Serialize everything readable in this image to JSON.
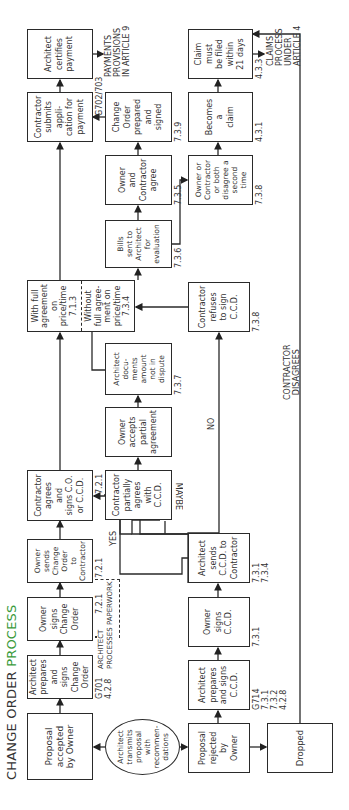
{
  "title": {
    "main": "CHANGE ORDER ",
    "accent": "PROCESS",
    "accent_color": "#3a9a3a"
  },
  "boxes": {
    "proposal_accepted": "Proposal\naccepted\nby Owner",
    "architect_prepares_co": "Architect\nprepares\nand signs\nChange\nOrder",
    "owner_signs_co": "Owner\nsigns\nChange\nOrder",
    "owner_sends_co": "Owner\nsends\nChange\nOrder\nto\nContractor",
    "contractor_agrees": "Contractor\nagrees\nand\nsigns C.O.\nor C.C.D.",
    "with_full_agreement": "With full\nagreement\non\nprice/time\n7.1.3",
    "without_full_agreement": "Without\nfull agree-\nment on\nprice/time\n7.3.4",
    "contractor_submits": "Contractor\nsubmits\nappli-\ncation for\npayment",
    "architect_certifies": "Architect\ncertifies\npayment",
    "architect_transmits": "Architect\ntransmits\nproposal\nwith\nrecommen-\ndations",
    "contractor_partially_agrees": "Contractor\npartially\nagrees\nwith\nC.C.D.",
    "owner_accepts_partial": "Owner\naccepts\npartial\nagreement",
    "architect_documents": "Architect\ndocu-\nments\namount\nnot in\ndispute",
    "bills_sent": "Bills\nsent to\nArchitect\nfor\nevaluation",
    "owner_contractor_agree": "Owner\nand\nContractor\nagree",
    "change_order_prepared": "Change\nOrder\nprepared\nand\nsigned",
    "proposal_rejected": "Proposal\nrejected\nby\nOwner",
    "architect_prepares_ccd": "Architect\nprepares\nand signs\nC.C.D.",
    "owner_signs_ccd": "Owner\nsigns\nC.C.D.",
    "architect_sends_ccd": "Architect\nsends\nC.C.D. to\nContractor",
    "contractor_refuses": "Contractor\nrefuses\nto sign\nC.C.D.",
    "disagree_second_time": "Owner or\nContractor\nor both\ndisagree a\nsecond\ntime",
    "becomes_claim": "Becomes\na\nclaim",
    "claim_filed": "Claim\nmust\nbe filed\nwithin\n21 days",
    "dropped": "Dropped"
  },
  "refs": {
    "g701": "G701\n4.2.8",
    "r721a": "7.2.1",
    "r721b": "7.2.1",
    "r721c": "7.2.1",
    "r721d": "7.2.1",
    "g702": "G702/703",
    "r737": "7.3.7",
    "r736": "7.3.6",
    "r735": "7.3.5",
    "r739": "7.3.9",
    "g714": "G714\n7.3.1\n7.3.2\n4.2.8",
    "r731": "7.3.1",
    "r731_734": "7.3.1\n7.3.4",
    "r738a": "7.3.8",
    "r738b": "7.3.8",
    "r431": "4.3.1",
    "r433": "4.3.3"
  },
  "notes": {
    "architect_processes": "ARCHITECT\nPROCESSES PAPERWORK",
    "payments": "PAYMENTS\nPROVISIONS\nIN ARTICLE 9",
    "claims": "CLAIMS\nPROCESS\nUNDER\nARTICLE 4",
    "contractor_disagrees": "CONTRACTOR\nDISAGREES"
  },
  "branch_labels": {
    "yes": "YES",
    "maybe": "MAYBE",
    "no": "NO"
  }
}
